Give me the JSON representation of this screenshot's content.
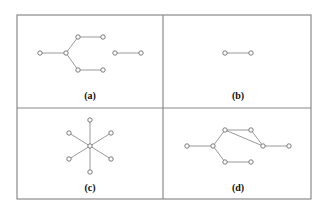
{
  "figure": {
    "frame": {
      "x": 17,
      "y": 15,
      "width": 294,
      "height": 184,
      "divider_x": 163,
      "divider_y": 108
    },
    "colors": {
      "border": "#8a8a8a",
      "edge": "#8f8f8f",
      "node_stroke": "#6e6e6e",
      "node_fill": "#ffffff",
      "label": "#111111"
    },
    "node_radius": 2.2,
    "panels": [
      {
        "id": "a",
        "label": "(a)",
        "label_pos": [
          90,
          99
        ],
        "nodes": [
          [
            40,
            53
          ],
          [
            66,
            53
          ],
          [
            78,
            37
          ],
          [
            103,
            37
          ],
          [
            78,
            70
          ],
          [
            103,
            70
          ],
          [
            115,
            53
          ],
          [
            141,
            53
          ]
        ],
        "edges": [
          [
            0,
            1
          ],
          [
            1,
            2
          ],
          [
            2,
            3
          ],
          [
            1,
            4
          ],
          [
            4,
            5
          ],
          [
            6,
            7
          ]
        ]
      },
      {
        "id": "b",
        "label": "(b)",
        "label_pos": [
          238,
          99
        ],
        "nodes": [
          [
            225,
            53
          ],
          [
            251,
            53
          ]
        ],
        "edges": [
          [
            0,
            1
          ]
        ]
      },
      {
        "id": "c",
        "label": "(c)",
        "label_pos": [
          90,
          191
        ],
        "nodes": [
          [
            90,
            146
          ],
          [
            90,
            120
          ],
          [
            69,
            133
          ],
          [
            111,
            133
          ],
          [
            69,
            159
          ],
          [
            111,
            159
          ],
          [
            90,
            172
          ]
        ],
        "edges": [
          [
            0,
            1
          ],
          [
            0,
            2
          ],
          [
            0,
            3
          ],
          [
            0,
            4
          ],
          [
            0,
            5
          ],
          [
            0,
            6
          ]
        ]
      },
      {
        "id": "d",
        "label": "(d)",
        "label_pos": [
          238,
          191
        ],
        "nodes": [
          [
            187,
            146
          ],
          [
            213,
            146
          ],
          [
            225,
            130
          ],
          [
            251,
            130
          ],
          [
            263,
            146
          ],
          [
            289,
            146
          ],
          [
            225,
            162
          ],
          [
            251,
            162
          ]
        ],
        "edges": [
          [
            0,
            1
          ],
          [
            1,
            2
          ],
          [
            1,
            6
          ],
          [
            2,
            3
          ],
          [
            2,
            4
          ],
          [
            3,
            4
          ],
          [
            4,
            5
          ],
          [
            6,
            7
          ]
        ]
      }
    ]
  }
}
